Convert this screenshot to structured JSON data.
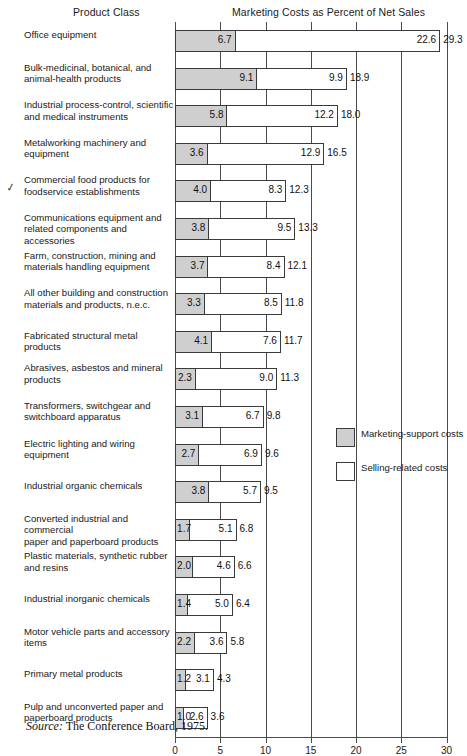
{
  "header": {
    "product_class": "Product Class",
    "costs_title": "Marketing Costs as Percent of Net Sales"
  },
  "source": {
    "prefix": "Source:",
    "text": " The Conference Board, 1975."
  },
  "annotation": {
    "check_mark_row_index": 4,
    "glyph": "✓"
  },
  "legend": {
    "position": "right-middle",
    "items": [
      {
        "label": "Marketing-support costs",
        "swatch": "support",
        "color": "#cfcfcf"
      },
      {
        "label": "Selling-related costs",
        "swatch": "selling",
        "color": "#ffffff"
      }
    ]
  },
  "colors": {
    "support_fill": "#cfcfcf",
    "selling_fill": "#ffffff",
    "stroke": "#3a3a3a",
    "grid": "#4a4a4a",
    "text": "#1a1a1a"
  },
  "chart_data": {
    "type": "bar",
    "orientation": "horizontal",
    "stacked": true,
    "title": "Marketing Costs as Percent of Net Sales",
    "xlabel": "",
    "ylabel": "Product Class",
    "xlim": [
      0,
      30
    ],
    "xticks": [
      0,
      5,
      10,
      15,
      20,
      25,
      30
    ],
    "xticklabels": [
      "0",
      "5",
      "10",
      "15",
      "20",
      "25",
      "30"
    ],
    "grid": true,
    "legend_entries": [
      "Marketing-support costs",
      "Selling-related costs"
    ],
    "categories": [
      "Office equipment",
      "Bulk-medicinal, botanical, and animal-health products",
      "Industrial process-control, scientific and medical instruments",
      "Metalworking machinery and equipment",
      "Commercial food products for foodservice establishments",
      "Communications equipment and related components and accessories",
      "Farm, construction, mining and materials handling equipment",
      "All other building and construction materials and products, n.e.c.",
      "Fabricated structural metal products",
      "Abrasives, asbestos and mineral products",
      "Transformers, switchgear and switchboard apparatus",
      "Electric lighting and wiring equipment",
      "Industrial organic chemicals",
      "Converted industrial and commercial paper and paperboard products",
      "Plastic materials, synthetic rubber and resins",
      "Industrial inorganic chemicals",
      "Motor vehicle parts and accessory items",
      "Primary metal products",
      "Pulp and unconverted paper and paperboard products"
    ],
    "series": [
      {
        "name": "Marketing-support costs",
        "values": [
          6.7,
          9.1,
          5.8,
          3.6,
          4.0,
          3.8,
          3.7,
          3.3,
          4.1,
          2.3,
          3.1,
          2.7,
          3.8,
          1.7,
          2.0,
          1.4,
          2.2,
          1.2,
          1.0
        ]
      },
      {
        "name": "Selling-related costs",
        "values": [
          22.6,
          9.9,
          12.2,
          12.9,
          8.3,
          9.5,
          8.4,
          8.5,
          7.6,
          9.0,
          6.7,
          6.9,
          5.7,
          5.1,
          4.6,
          5.0,
          3.6,
          3.1,
          2.6
        ]
      }
    ],
    "totals": [
      29.3,
      18.9,
      18.0,
      16.5,
      12.3,
      13.3,
      12.1,
      11.8,
      11.7,
      11.3,
      9.8,
      9.6,
      9.5,
      6.8,
      6.6,
      6.4,
      5.8,
      4.3,
      3.6
    ],
    "rows": [
      {
        "label_line1": "Office equipment",
        "label_line2": "",
        "support": 6.7,
        "selling": 22.6,
        "total": 29.3
      },
      {
        "label_line1": "Bulk-medicinal, botanical, and",
        "label_line2": "animal-health products",
        "support": 9.1,
        "selling": 9.9,
        "total": 18.9
      },
      {
        "label_line1": "Industrial process-control, scientific",
        "label_line2": "and medical instruments",
        "support": 5.8,
        "selling": 12.2,
        "total": 18.0
      },
      {
        "label_line1": "Metalworking machinery and",
        "label_line2": "equipment",
        "support": 3.6,
        "selling": 12.9,
        "total": 16.5
      },
      {
        "label_line1": "Commercial food products for",
        "label_line2": "foodservice establishments",
        "support": 4.0,
        "selling": 8.3,
        "total": 12.3
      },
      {
        "label_line1": "Communications equipment and",
        "label_line2": "related components and accessories",
        "support": 3.8,
        "selling": 9.5,
        "total": 13.3
      },
      {
        "label_line1": "Farm, construction, mining and",
        "label_line2": "materials handling equipment",
        "support": 3.7,
        "selling": 8.4,
        "total": 12.1
      },
      {
        "label_line1": "All other building and construction",
        "label_line2": "materials and products, n.e.c.",
        "support": 3.3,
        "selling": 8.5,
        "total": 11.8
      },
      {
        "label_line1": "Fabricated structural metal products",
        "label_line2": "",
        "support": 4.1,
        "selling": 7.6,
        "total": 11.7
      },
      {
        "label_line1": "Abrasives, asbestos and mineral",
        "label_line2": "products",
        "support": 2.3,
        "selling": 9.0,
        "total": 11.3
      },
      {
        "label_line1": "Transformers, switchgear and",
        "label_line2": "switchboard apparatus",
        "support": 3.1,
        "selling": 6.7,
        "total": 9.8
      },
      {
        "label_line1": "Electric lighting and wiring",
        "label_line2": "equipment",
        "support": 2.7,
        "selling": 6.9,
        "total": 9.6
      },
      {
        "label_line1": "Industrial organic chemicals",
        "label_line2": "",
        "support": 3.8,
        "selling": 5.7,
        "total": 9.5
      },
      {
        "label_line1": "Converted industrial and commercial",
        "label_line2": "paper and paperboard products",
        "support": 1.7,
        "selling": 5.1,
        "total": 6.8
      },
      {
        "label_line1": "Plastic materials, synthetic rubber",
        "label_line2": "and resins",
        "support": 2.0,
        "selling": 4.6,
        "total": 6.6
      },
      {
        "label_line1": "Industrial inorganic chemicals",
        "label_line2": "",
        "support": 1.4,
        "selling": 5.0,
        "total": 6.4
      },
      {
        "label_line1": "Motor vehicle parts and accessory",
        "label_line2": "items",
        "support": 2.2,
        "selling": 3.6,
        "total": 5.8
      },
      {
        "label_line1": "Primary metal products",
        "label_line2": "",
        "support": 1.2,
        "selling": 3.1,
        "total": 4.3
      },
      {
        "label_line1": "Pulp and unconverted paper and",
        "label_line2": "paperboard products",
        "support": 1.0,
        "selling": 2.6,
        "total": 3.6
      }
    ]
  }
}
